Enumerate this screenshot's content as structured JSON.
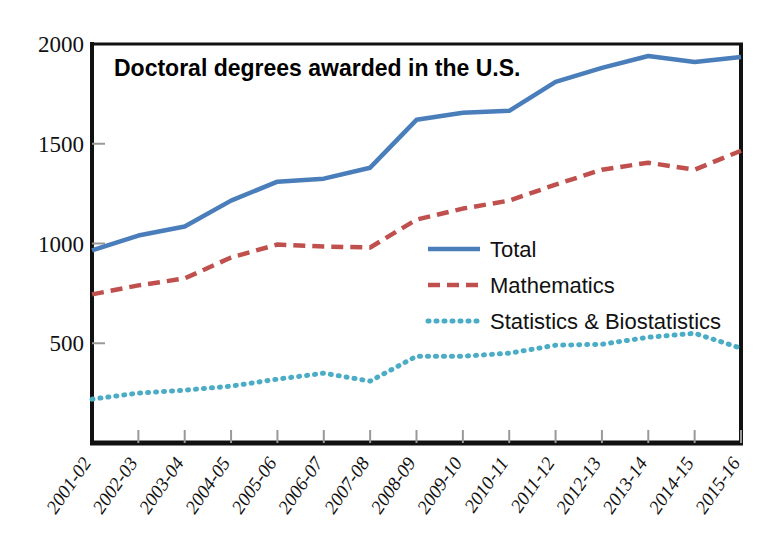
{
  "chart_data": {
    "type": "line",
    "title": "Doctoral degrees awarded in the U.S.",
    "xlabel": "",
    "ylabel": "",
    "ylim": [
      0,
      2000
    ],
    "yticks": [
      500,
      1000,
      1500,
      2000
    ],
    "grid": false,
    "legend_position": "center-right inside plot",
    "categories": [
      "2001-02",
      "2002-03",
      "2003-04",
      "2004-05",
      "2005-06",
      "2006-07",
      "2007-08",
      "2008-09",
      "2009-10",
      "2010-11",
      "2011-12",
      "2012-13",
      "2013-14",
      "2014-15",
      "2015-16"
    ],
    "series": [
      {
        "name": "Total",
        "color": "#4A7EBB",
        "style": "solid",
        "values": [
          965,
          1040,
          1085,
          1215,
          1310,
          1325,
          1380,
          1620,
          1655,
          1665,
          1810,
          1880,
          1940,
          1910,
          1935
        ]
      },
      {
        "name": "Mathematics",
        "color": "#C0504D",
        "style": "dashed",
        "values": [
          745,
          790,
          825,
          930,
          995,
          985,
          980,
          1120,
          1175,
          1215,
          1295,
          1370,
          1405,
          1370,
          1465
        ]
      },
      {
        "name": "Statistics & Biostatistics",
        "color": "#4BACC6",
        "style": "dotted",
        "values": [
          220,
          250,
          265,
          285,
          320,
          350,
          310,
          435,
          435,
          450,
          490,
          495,
          530,
          550,
          475
        ]
      }
    ]
  },
  "axes": {
    "ytick_labels": [
      "2000",
      "1500",
      "1000",
      "500"
    ],
    "xtick_labels": [
      "2001-02",
      "2002-03",
      "2003-04",
      "2004-05",
      "2005-06",
      "2006-07",
      "2007-08",
      "2008-09",
      "2009-10",
      "2010-11",
      "2011-12",
      "2012-13",
      "2013-14",
      "2014-15",
      "2015-16"
    ]
  },
  "legend": {
    "items": [
      {
        "label": "Total",
        "color": "#4A7EBB",
        "style": "solid"
      },
      {
        "label": "Mathematics",
        "color": "#C0504D",
        "style": "dashed"
      },
      {
        "label": "Statistics & Biostatistics",
        "color": "#4BACC6",
        "style": "dotted"
      }
    ]
  },
  "colors": {
    "total": "#4A7EBB",
    "mathematics": "#C0504D",
    "statistics": "#4BACC6",
    "axis": "#111111",
    "background": "#ffffff"
  }
}
